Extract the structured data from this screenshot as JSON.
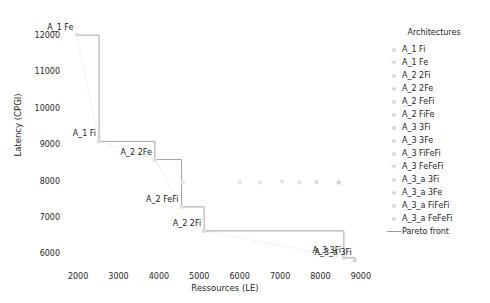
{
  "chart_data": {
    "type": "scatter",
    "title": "",
    "xlabel": "Ressources (LE)",
    "ylabel": "Latency (CPGI)",
    "xlim": [
      1750,
      9350
    ],
    "ylim": [
      5600,
      12250
    ],
    "xticks": [
      2000,
      3000,
      4000,
      5000,
      6000,
      7000,
      8000,
      9000
    ],
    "yticks": [
      6000,
      7000,
      8000,
      9000,
      10000,
      11000,
      12000
    ],
    "grid": false,
    "legend_position": "right",
    "legend_title": "Architectures",
    "series": [
      {
        "name": "A_1 Fi",
        "marker": "circle",
        "color": "#dcdcdc",
        "x": [
          2520
        ],
        "y": [
          9080
        ]
      },
      {
        "name": "A_1 Fe",
        "marker": "triangle",
        "color": "#dedede",
        "x": [
          1960
        ],
        "y": [
          12000
        ]
      },
      {
        "name": "A_2 2Fi",
        "marker": "circle",
        "color": "#dadada",
        "x": [
          5120
        ],
        "y": [
          6620
        ]
      },
      {
        "name": "A_2 2Fe",
        "marker": "circle",
        "color": "#dedede",
        "x": [
          3900
        ],
        "y": [
          8580
        ]
      },
      {
        "name": "A_2 FeFi",
        "marker": "circle",
        "color": "#e2e2e2",
        "x": [
          4560
        ],
        "y": [
          7280
        ]
      },
      {
        "name": "A_2 FiFe",
        "marker": "circle",
        "color": "#ebebeb",
        "x": [
          4600
        ],
        "y": [
          7950
        ]
      },
      {
        "name": "A_3 3Fi",
        "marker": "circle",
        "color": "#d8d8d8",
        "x": [
          8580
        ],
        "y": [
          5880
        ]
      },
      {
        "name": "A_3 3Fe",
        "marker": "circle",
        "color": "#e6e6e6",
        "x": [
          6000
        ],
        "y": [
          7960
        ]
      },
      {
        "name": "A_3 FiFeFi",
        "marker": "circle",
        "color": "#e4e4e4",
        "x": [
          6500
        ],
        "y": [
          7950
        ]
      },
      {
        "name": "A_3 FeFeFi",
        "marker": "triangle",
        "color": "#e0e0e0",
        "x": [
          7050
        ],
        "y": [
          7960
        ]
      },
      {
        "name": "A_3_a 3Fi",
        "marker": "circle",
        "color": "#d6d6d6",
        "x": [
          8850
        ],
        "y": [
          5810
        ]
      },
      {
        "name": "A_3_a 3Fe",
        "marker": "circle",
        "color": "#e2e2e2",
        "x": [
          7480
        ],
        "y": [
          7950
        ]
      },
      {
        "name": "A_3_a FiFeFi",
        "marker": "circle",
        "color": "#dcdcdc",
        "x": [
          7900
        ],
        "y": [
          7960
        ]
      },
      {
        "name": "A_3_a FeFeFi",
        "marker": "circle",
        "color": "#d4d4d4",
        "x": [
          8450
        ],
        "y": [
          7950
        ]
      }
    ],
    "pareto_front": {
      "label": "Pareto front",
      "color": "#9a9a9a",
      "x": [
        1960,
        2520,
        3900,
        4560,
        5120,
        8580,
        8850
      ],
      "y": [
        12000,
        9080,
        8580,
        7280,
        6620,
        5880,
        5810
      ]
    },
    "annotations": [
      {
        "text": "A_1 Fe",
        "x": 1960,
        "y": 12000
      },
      {
        "text": "A_1 Fi",
        "x": 2520,
        "y": 9080
      },
      {
        "text": "A_2 2Fe",
        "x": 3900,
        "y": 8580
      },
      {
        "text": "A_2 FeFi",
        "x": 4560,
        "y": 7280
      },
      {
        "text": "A_2 2Fi",
        "x": 5120,
        "y": 6620
      },
      {
        "text": "A_3 3Fi",
        "x": 8580,
        "y": 5880
      },
      {
        "text": "A_3_a 3Fi",
        "x": 8850,
        "y": 5810
      }
    ]
  },
  "legend": {
    "title": "Architectures",
    "entries": [
      {
        "label": "A_1 Fi",
        "marker": "circle"
      },
      {
        "label": "A_1 Fe",
        "marker": "triangle"
      },
      {
        "label": "A_2 2Fi",
        "marker": "circle"
      },
      {
        "label": "A_2 2Fe",
        "marker": "circle"
      },
      {
        "label": "A_2 FeFi",
        "marker": "circle"
      },
      {
        "label": "A_2 FiFe",
        "marker": "circle"
      },
      {
        "label": "A_3 3Fi",
        "marker": "circle"
      },
      {
        "label": "A_3 3Fe",
        "marker": "circle"
      },
      {
        "label": "A_3 FiFeFi",
        "marker": "circle"
      },
      {
        "label": "A_3 FeFeFi",
        "marker": "triangle"
      },
      {
        "label": "A_3_a 3Fi",
        "marker": "circle"
      },
      {
        "label": "A_3_a 3Fe",
        "marker": "circle"
      },
      {
        "label": "A_3_a FiFeFi",
        "marker": "circle"
      },
      {
        "label": "A_3_a FeFeFi",
        "marker": "circle"
      },
      {
        "label": "Pareto front",
        "marker": "line"
      }
    ]
  },
  "axes": {
    "xlabel": "Ressources (LE)",
    "ylabel": "Latency (CPGI)",
    "xticks": [
      "2000",
      "3000",
      "4000",
      "5000",
      "6000",
      "7000",
      "8000",
      "9000"
    ],
    "yticks": [
      "6000",
      "7000",
      "8000",
      "9000",
      "10000",
      "11000",
      "12000"
    ]
  }
}
